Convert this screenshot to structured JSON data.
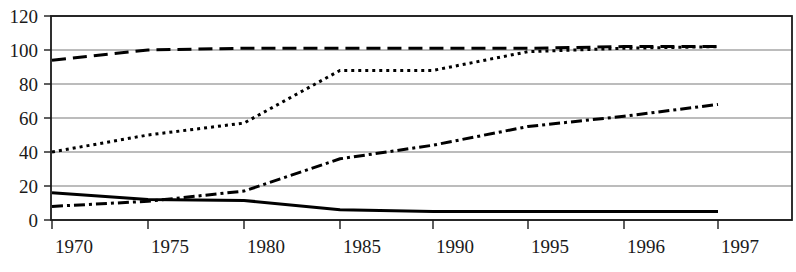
{
  "chart_data": {
    "type": "line",
    "title": "",
    "xlabel": "",
    "ylabel": "",
    "categories": [
      "1970",
      "1975",
      "1980",
      "1985",
      "1990",
      "1995",
      "1996",
      "1997"
    ],
    "x_tick_labels": [
      "1970",
      "1975",
      "1980",
      "1985",
      "1990",
      "1995",
      "1996",
      "1997"
    ],
    "y_tick_labels": [
      "0",
      "20",
      "40",
      "60",
      "80",
      "100",
      "120"
    ],
    "y_ticks": [
      0,
      20,
      40,
      60,
      80,
      100,
      120
    ],
    "ylim": [
      0,
      120
    ],
    "grid": true,
    "grid_axis": "y",
    "legend": "none",
    "line_color": "#000000",
    "grid_color": "#7a7a7a",
    "axis_color": "#1a1a1a",
    "background": "#ffffff",
    "series": [
      {
        "name": "series-long-dash",
        "style": "long-dashed",
        "dash_pattern": "14,7",
        "width": 3,
        "values": [
          94,
          100,
          101,
          101,
          101,
          101,
          102,
          102
        ]
      },
      {
        "name": "series-dotted",
        "style": "dotted",
        "dash_pattern": "3,4",
        "width": 3,
        "values": [
          40,
          50,
          57,
          88,
          88,
          99,
          101,
          102
        ]
      },
      {
        "name": "series-dash-dot",
        "style": "dash-dot",
        "dash_pattern": "11,4,3,4",
        "width": 3,
        "values": [
          8,
          11,
          17,
          36,
          44,
          55,
          61,
          68
        ]
      },
      {
        "name": "series-solid",
        "style": "solid",
        "dash_pattern": "",
        "width": 3,
        "values": [
          16,
          12,
          11.5,
          6,
          5,
          5,
          5,
          5
        ]
      }
    ]
  },
  "plot_geometry": {
    "left": 51,
    "right": 792,
    "top": 16,
    "bottom": 220,
    "x_tick_positions": [
      52,
      148,
      244,
      340,
      433,
      528,
      624,
      718
    ]
  }
}
